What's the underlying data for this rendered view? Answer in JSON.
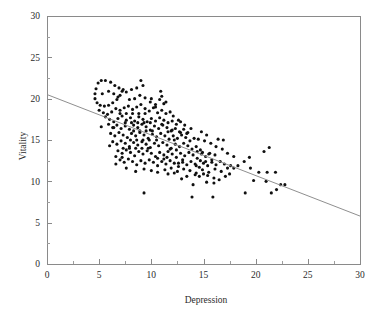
{
  "chart_data": {
    "type": "scatter",
    "title": "",
    "xlabel": "Depression",
    "ylabel": "Vitality",
    "xlim": [
      0,
      30
    ],
    "ylim": [
      0,
      30
    ],
    "xticks": [
      0,
      5,
      10,
      15,
      20,
      25,
      30
    ],
    "yticks": [
      0,
      5,
      10,
      15,
      20,
      25,
      30
    ],
    "xtick_labels": [
      "0",
      "5",
      "10",
      "15",
      "20",
      "25",
      "30"
    ],
    "ytick_labels": [
      "0",
      "5",
      "10",
      "15",
      "20",
      "25",
      "30"
    ],
    "xminor_interval": 2.5,
    "yminor_interval": 2.5,
    "grid": false,
    "legend": false,
    "marker": "filled-circle",
    "marker_color": "#101010",
    "marker_size_px": 3.1,
    "box_frame": true,
    "frame_color": "#8a8a8a",
    "background_color": "#ffffff",
    "fit_line": {
      "label": "linear regression",
      "color": "#8f8f8f",
      "x": [
        0,
        30
      ],
      "y": [
        20.5,
        5.8
      ],
      "slope": -0.49,
      "intercept": 20.5
    },
    "n_points": 301,
    "points": [
      [
        4.9,
        21.9
      ],
      [
        5.2,
        22.2
      ],
      [
        5.6,
        22.2
      ],
      [
        6.1,
        22.0
      ],
      [
        6.5,
        21.6
      ],
      [
        6.9,
        21.3
      ],
      [
        7.3,
        21.1
      ],
      [
        4.7,
        21.2
      ],
      [
        4.6,
        20.6
      ],
      [
        4.6,
        20.0
      ],
      [
        4.8,
        19.5
      ],
      [
        5.1,
        19.2
      ],
      [
        5.5,
        19.1
      ],
      [
        5.9,
        19.2
      ],
      [
        6.3,
        19.5
      ],
      [
        6.7,
        19.9
      ],
      [
        7.0,
        20.4
      ],
      [
        7.2,
        20.9
      ],
      [
        5.3,
        20.6
      ],
      [
        5.9,
        20.9
      ],
      [
        6.4,
        20.6
      ],
      [
        6.8,
        20.2
      ],
      [
        7.6,
        20.8
      ],
      [
        8.1,
        21.1
      ],
      [
        8.6,
        21.3
      ],
      [
        9.0,
        22.2
      ],
      [
        9.2,
        21.6
      ],
      [
        7.9,
        19.9
      ],
      [
        8.4,
        20.0
      ],
      [
        8.9,
        20.4
      ],
      [
        9.4,
        20.1
      ],
      [
        9.9,
        19.6
      ],
      [
        10.4,
        19.3
      ],
      [
        10.9,
        20.9
      ],
      [
        11.2,
        19.4
      ],
      [
        5.0,
        18.6
      ],
      [
        5.4,
        18.3
      ],
      [
        5.8,
        18.1
      ],
      [
        6.2,
        18.4
      ],
      [
        6.6,
        18.8
      ],
      [
        7.0,
        18.6
      ],
      [
        7.4,
        18.9
      ],
      [
        7.8,
        19.1
      ],
      [
        8.2,
        18.7
      ],
      [
        8.6,
        19.0
      ],
      [
        9.0,
        19.3
      ],
      [
        9.4,
        18.8
      ],
      [
        9.8,
        18.5
      ],
      [
        10.2,
        18.9
      ],
      [
        10.6,
        18.3
      ],
      [
        11.0,
        18.6
      ],
      [
        11.4,
        18.2
      ],
      [
        11.8,
        18.4
      ],
      [
        12.1,
        17.9
      ],
      [
        5.6,
        17.8
      ],
      [
        6.0,
        17.5
      ],
      [
        6.4,
        17.2
      ],
      [
        6.8,
        17.6
      ],
      [
        7.2,
        17.9
      ],
      [
        7.6,
        17.4
      ],
      [
        8.0,
        17.7
      ],
      [
        8.4,
        17.3
      ],
      [
        8.8,
        17.8
      ],
      [
        9.2,
        17.5
      ],
      [
        9.6,
        17.2
      ],
      [
        10.0,
        17.6
      ],
      [
        10.4,
        17.3
      ],
      [
        10.8,
        17.7
      ],
      [
        11.2,
        17.4
      ],
      [
        11.6,
        17.1
      ],
      [
        12.0,
        17.3
      ],
      [
        12.4,
        16.9
      ],
      [
        12.8,
        17.2
      ],
      [
        5.2,
        16.6
      ],
      [
        5.9,
        16.9
      ],
      [
        6.3,
        16.5
      ],
      [
        6.7,
        16.8
      ],
      [
        7.1,
        16.4
      ],
      [
        7.5,
        16.7
      ],
      [
        7.9,
        16.3
      ],
      [
        8.3,
        16.8
      ],
      [
        8.7,
        16.5
      ],
      [
        9.1,
        16.9
      ],
      [
        9.5,
        16.6
      ],
      [
        9.9,
        16.2
      ],
      [
        10.3,
        16.7
      ],
      [
        10.7,
        16.4
      ],
      [
        11.1,
        16.8
      ],
      [
        11.5,
        16.5
      ],
      [
        11.9,
        16.1
      ],
      [
        12.3,
        16.4
      ],
      [
        12.7,
        16.0
      ],
      [
        13.1,
        16.3
      ],
      [
        13.5,
        15.9
      ],
      [
        6.1,
        15.8
      ],
      [
        6.5,
        15.5
      ],
      [
        6.9,
        15.9
      ],
      [
        7.3,
        15.6
      ],
      [
        7.7,
        15.3
      ],
      [
        8.1,
        15.8
      ],
      [
        8.5,
        15.5
      ],
      [
        8.9,
        15.9
      ],
      [
        9.3,
        15.6
      ],
      [
        9.7,
        15.2
      ],
      [
        10.1,
        15.7
      ],
      [
        10.5,
        15.4
      ],
      [
        10.9,
        15.8
      ],
      [
        11.3,
        15.5
      ],
      [
        11.7,
        15.1
      ],
      [
        12.1,
        15.5
      ],
      [
        12.5,
        15.2
      ],
      [
        12.9,
        15.6
      ],
      [
        13.3,
        15.3
      ],
      [
        13.7,
        14.9
      ],
      [
        14.1,
        15.2
      ],
      [
        6.3,
        14.8
      ],
      [
        6.7,
        14.5
      ],
      [
        7.1,
        14.9
      ],
      [
        7.5,
        14.6
      ],
      [
        7.9,
        14.2
      ],
      [
        8.3,
        14.7
      ],
      [
        8.7,
        14.4
      ],
      [
        9.1,
        14.8
      ],
      [
        9.5,
        14.5
      ],
      [
        9.9,
        14.1
      ],
      [
        10.3,
        14.6
      ],
      [
        10.7,
        14.3
      ],
      [
        11.1,
        14.7
      ],
      [
        11.5,
        14.4
      ],
      [
        11.9,
        14.0
      ],
      [
        12.3,
        14.5
      ],
      [
        12.7,
        14.2
      ],
      [
        13.1,
        14.6
      ],
      [
        13.5,
        14.3
      ],
      [
        13.9,
        13.9
      ],
      [
        14.3,
        14.2
      ],
      [
        14.7,
        13.8
      ],
      [
        6.8,
        13.7
      ],
      [
        7.2,
        13.4
      ],
      [
        7.6,
        13.8
      ],
      [
        8.0,
        13.5
      ],
      [
        8.4,
        13.1
      ],
      [
        8.8,
        13.6
      ],
      [
        9.2,
        13.3
      ],
      [
        9.6,
        13.7
      ],
      [
        10.0,
        13.4
      ],
      [
        10.4,
        13.0
      ],
      [
        10.8,
        13.5
      ],
      [
        11.2,
        13.2
      ],
      [
        11.6,
        13.6
      ],
      [
        12.0,
        13.3
      ],
      [
        12.4,
        12.9
      ],
      [
        12.8,
        13.4
      ],
      [
        13.2,
        13.1
      ],
      [
        13.6,
        13.5
      ],
      [
        14.0,
        13.2
      ],
      [
        14.4,
        12.8
      ],
      [
        14.8,
        13.3
      ],
      [
        15.2,
        13.0
      ],
      [
        15.6,
        13.4
      ],
      [
        7.0,
        12.6
      ],
      [
        7.4,
        12.3
      ],
      [
        7.8,
        12.7
      ],
      [
        8.2,
        12.4
      ],
      [
        8.6,
        12.0
      ],
      [
        9.0,
        12.5
      ],
      [
        9.4,
        12.2
      ],
      [
        9.8,
        12.6
      ],
      [
        10.2,
        12.3
      ],
      [
        10.6,
        11.9
      ],
      [
        11.0,
        12.4
      ],
      [
        11.4,
        12.1
      ],
      [
        11.8,
        12.5
      ],
      [
        12.2,
        12.2
      ],
      [
        12.6,
        11.8
      ],
      [
        13.0,
        12.3
      ],
      [
        13.4,
        12.0
      ],
      [
        13.8,
        12.4
      ],
      [
        14.2,
        12.1
      ],
      [
        14.6,
        11.7
      ],
      [
        15.0,
        12.2
      ],
      [
        15.4,
        11.9
      ],
      [
        15.8,
        12.3
      ],
      [
        16.2,
        12.0
      ],
      [
        16.6,
        12.4
      ],
      [
        17.0,
        12.1
      ],
      [
        6.6,
        12.1
      ],
      [
        7.6,
        11.6
      ],
      [
        8.5,
        11.2
      ],
      [
        9.3,
        11.5
      ],
      [
        10.0,
        11.3
      ],
      [
        10.6,
        11.1
      ],
      [
        11.3,
        11.4
      ],
      [
        11.9,
        11.6
      ],
      [
        12.5,
        11.2
      ],
      [
        13.1,
        11.5
      ],
      [
        13.7,
        11.3
      ],
      [
        14.3,
        11.0
      ],
      [
        14.9,
        11.4
      ],
      [
        15.5,
        11.1
      ],
      [
        16.1,
        11.5
      ],
      [
        16.7,
        11.2
      ],
      [
        17.3,
        11.6
      ],
      [
        17.6,
        11.9
      ],
      [
        17.9,
        11.6
      ],
      [
        14.2,
        10.8
      ],
      [
        14.6,
        10.6
      ],
      [
        15.0,
        10.9
      ],
      [
        15.4,
        10.7
      ],
      [
        16.0,
        10.4
      ],
      [
        16.5,
        10.2
      ],
      [
        17.1,
        10.6
      ],
      [
        17.5,
        10.9
      ],
      [
        12.9,
        10.3
      ],
      [
        13.4,
        10.6
      ],
      [
        11.6,
        10.9
      ],
      [
        12.2,
        11.0
      ],
      [
        14.0,
        9.6
      ],
      [
        15.3,
        9.9
      ],
      [
        16.0,
        9.8
      ],
      [
        13.9,
        8.1
      ],
      [
        15.9,
        8.1
      ],
      [
        9.3,
        8.6
      ],
      [
        19.0,
        8.6
      ],
      [
        21.5,
        8.6
      ],
      [
        22.0,
        9.0
      ],
      [
        22.4,
        9.6
      ],
      [
        22.8,
        9.6
      ],
      [
        21.0,
        10.0
      ],
      [
        19.8,
        10.1
      ],
      [
        20.3,
        11.1
      ],
      [
        21.1,
        11.1
      ],
      [
        21.9,
        11.1
      ],
      [
        19.5,
        11.6
      ],
      [
        18.3,
        11.9
      ],
      [
        18.9,
        12.4
      ],
      [
        19.4,
        12.9
      ],
      [
        20.8,
        13.6
      ],
      [
        21.3,
        14.1
      ],
      [
        17.9,
        13.0
      ],
      [
        17.3,
        13.4
      ],
      [
        16.8,
        13.9
      ],
      [
        16.2,
        14.2
      ],
      [
        15.7,
        14.6
      ],
      [
        15.1,
        14.9
      ],
      [
        14.5,
        15.1
      ],
      [
        14.8,
        16.0
      ],
      [
        15.3,
        15.6
      ],
      [
        13.8,
        16.4
      ],
      [
        13.2,
        16.8
      ],
      [
        12.6,
        17.4
      ],
      [
        12.0,
        16.2
      ],
      [
        11.4,
        19.6
      ],
      [
        10.8,
        19.9
      ],
      [
        11.0,
        20.3
      ],
      [
        10.5,
        15.0
      ],
      [
        9.8,
        15.0
      ],
      [
        9.2,
        15.0
      ],
      [
        8.6,
        15.0
      ],
      [
        8.0,
        15.0
      ],
      [
        8.3,
        16.1
      ],
      [
        8.9,
        16.1
      ],
      [
        9.5,
        16.1
      ],
      [
        10.1,
        16.1
      ],
      [
        8.7,
        17.1
      ],
      [
        9.3,
        17.1
      ],
      [
        9.9,
        17.1
      ],
      [
        8.1,
        17.1
      ],
      [
        7.5,
        17.1
      ],
      [
        8.5,
        14.0
      ],
      [
        9.1,
        14.0
      ],
      [
        9.7,
        14.0
      ],
      [
        7.9,
        14.0
      ],
      [
        7.3,
        14.0
      ],
      [
        8.2,
        18.2
      ],
      [
        8.8,
        18.2
      ],
      [
        7.6,
        18.2
      ],
      [
        7.0,
        18.2
      ],
      [
        9.4,
        18.2
      ],
      [
        6.4,
        16.5
      ],
      [
        6.0,
        14.3
      ],
      [
        6.6,
        13.0
      ],
      [
        7.2,
        12.9
      ],
      [
        10.6,
        12.8
      ],
      [
        11.2,
        12.7
      ],
      [
        11.8,
        13.9
      ],
      [
        12.4,
        13.8
      ],
      [
        13.0,
        12.6
      ],
      [
        12.6,
        12.2
      ],
      [
        11.5,
        12.9
      ],
      [
        14.4,
        13.6
      ],
      [
        14.9,
        13.5
      ],
      [
        15.5,
        13.3
      ],
      [
        16.1,
        13.2
      ],
      [
        14.7,
        12.5
      ],
      [
        15.2,
        12.4
      ],
      [
        15.8,
        12.6
      ],
      [
        14.3,
        11.9
      ],
      [
        16.4,
        15.1
      ],
      [
        16.9,
        15.0
      ],
      [
        12.8,
        15.9
      ],
      [
        13.4,
        15.8
      ],
      [
        12.2,
        15.0
      ],
      [
        11.6,
        16.0
      ],
      [
        11.0,
        16.9
      ],
      [
        10.4,
        19.0
      ],
      [
        10.0,
        20.0
      ]
    ]
  }
}
